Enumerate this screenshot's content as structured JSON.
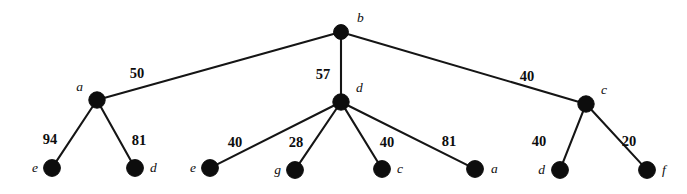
{
  "figure": {
    "background_color": "#ffffff",
    "node_color": "#0d0d0d",
    "edge_color": "#151515"
  },
  "chart_data": {
    "type": "diagram",
    "diagram_kind": "weighted-tree",
    "title": "",
    "root": "b",
    "nodes": [
      {
        "id": "n-root-b",
        "label": "b",
        "x": 341,
        "y": 32,
        "r": 7.4,
        "label_x": 357,
        "label_y": 22,
        "label_anchor": "start"
      },
      {
        "id": "n-a",
        "label": "a",
        "x": 97,
        "y": 100,
        "r": 8.2,
        "label_x": 83,
        "label_y": 91,
        "label_anchor": "end"
      },
      {
        "id": "n-d-mid",
        "label": "d",
        "x": 341,
        "y": 102,
        "r": 8.2,
        "label_x": 356,
        "label_y": 92,
        "label_anchor": "start"
      },
      {
        "id": "n-c",
        "label": "c",
        "x": 586,
        "y": 104,
        "r": 8.2,
        "label_x": 601,
        "label_y": 94,
        "label_anchor": "start"
      },
      {
        "id": "n-leaf-e1",
        "label": "e",
        "x": 52,
        "y": 168,
        "r": 8.4,
        "label_x": 38,
        "label_y": 172,
        "label_anchor": "end"
      },
      {
        "id": "n-leaf-d1",
        "label": "d",
        "x": 135,
        "y": 168,
        "r": 8.4,
        "label_x": 150,
        "label_y": 172,
        "label_anchor": "start"
      },
      {
        "id": "n-leaf-e2",
        "label": "e",
        "x": 210,
        "y": 168,
        "r": 8.4,
        "label_x": 196,
        "label_y": 172,
        "label_anchor": "end"
      },
      {
        "id": "n-leaf-g",
        "label": "g",
        "x": 295,
        "y": 170,
        "r": 8.4,
        "label_x": 281,
        "label_y": 174,
        "label_anchor": "end"
      },
      {
        "id": "n-leaf-c",
        "label": "c",
        "x": 382,
        "y": 169,
        "r": 8.4,
        "label_x": 397,
        "label_y": 173,
        "label_anchor": "start"
      },
      {
        "id": "n-leaf-a",
        "label": "a",
        "x": 475,
        "y": 169,
        "r": 8.4,
        "label_x": 491,
        "label_y": 173,
        "label_anchor": "start"
      },
      {
        "id": "n-leaf-d2",
        "label": "d",
        "x": 560,
        "y": 170,
        "r": 8.4,
        "label_x": 545,
        "label_y": 174,
        "label_anchor": "end"
      },
      {
        "id": "n-leaf-f",
        "label": "f",
        "x": 647,
        "y": 170,
        "r": 8.4,
        "label_x": 662,
        "label_y": 174,
        "label_anchor": "start"
      }
    ],
    "edges": [
      {
        "id": "e-b-a",
        "from": "n-root-b",
        "to": "n-a",
        "weight": "50",
        "label_x": 137,
        "label_y": 78
      },
      {
        "id": "e-b-d",
        "from": "n-root-b",
        "to": "n-d-mid",
        "weight": "57",
        "label_x": 323,
        "label_y": 79
      },
      {
        "id": "e-b-c",
        "from": "n-root-b",
        "to": "n-c",
        "weight": "40",
        "label_x": 527,
        "label_y": 81
      },
      {
        "id": "e-a-e",
        "from": "n-a",
        "to": "n-leaf-e1",
        "weight": "94",
        "label_x": 50,
        "label_y": 144
      },
      {
        "id": "e-a-d",
        "from": "n-a",
        "to": "n-leaf-d1",
        "weight": "81",
        "label_x": 139,
        "label_y": 145
      },
      {
        "id": "e-d-e",
        "from": "n-d-mid",
        "to": "n-leaf-e2",
        "weight": "40",
        "label_x": 235,
        "label_y": 147
      },
      {
        "id": "e-d-g",
        "from": "n-d-mid",
        "to": "n-leaf-g",
        "weight": "28",
        "label_x": 296,
        "label_y": 147
      },
      {
        "id": "e-d-c",
        "from": "n-d-mid",
        "to": "n-leaf-c",
        "weight": "40",
        "label_x": 387,
        "label_y": 147
      },
      {
        "id": "e-d-a",
        "from": "n-d-mid",
        "to": "n-leaf-a",
        "weight": "81",
        "label_x": 449,
        "label_y": 146
      },
      {
        "id": "e-c-d",
        "from": "n-c",
        "to": "n-leaf-d2",
        "weight": "40",
        "label_x": 539,
        "label_y": 146
      },
      {
        "id": "e-c-f",
        "from": "n-c",
        "to": "n-leaf-f",
        "weight": "20",
        "label_x": 629,
        "label_y": 146
      }
    ]
  }
}
